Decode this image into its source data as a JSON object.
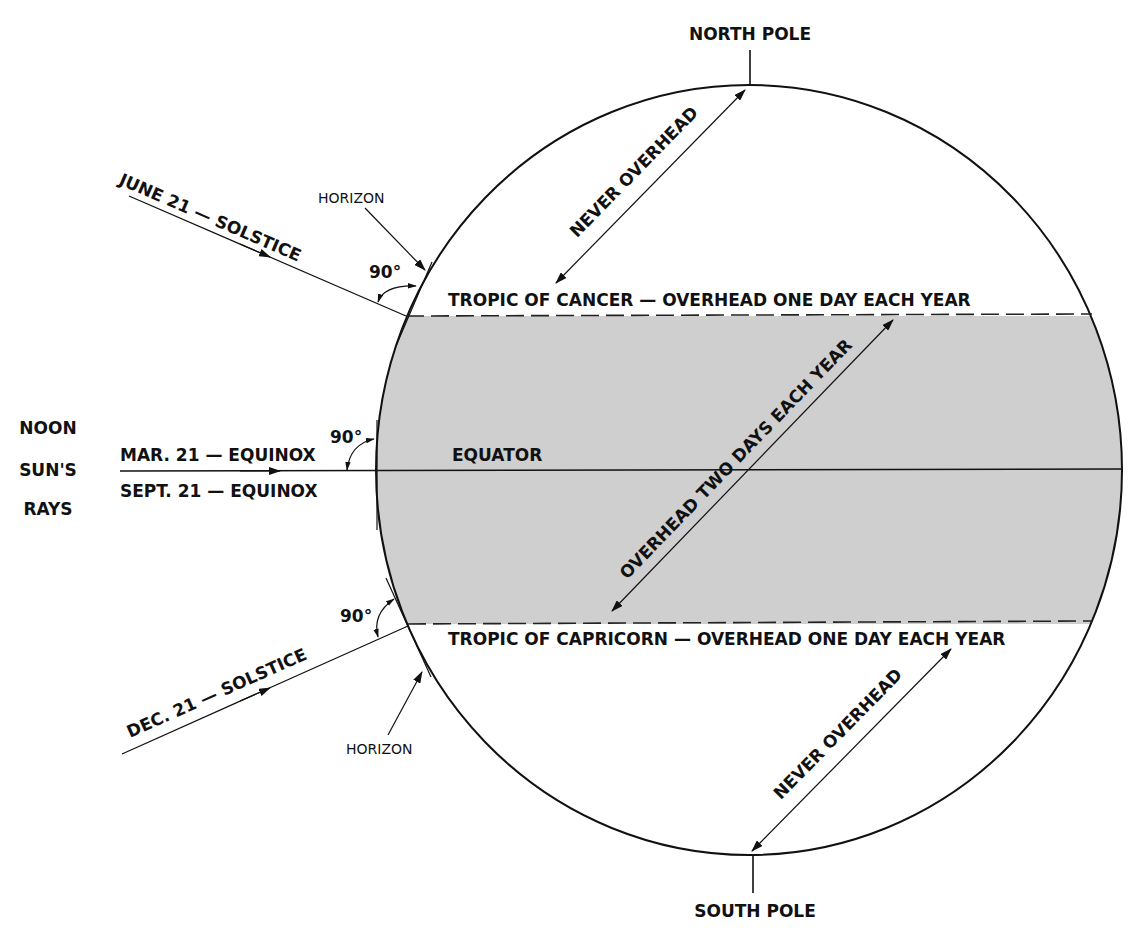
{
  "diagram": {
    "title_labels": {
      "north_pole": "NORTH POLE",
      "south_pole": "SOUTH POLE",
      "noon": "NOON",
      "suns": "SUN'S",
      "rays": "RAYS"
    },
    "rays": {
      "june": "JUNE 21 — SOLSTICE",
      "march": "MAR. 21 — EQUINOX",
      "september": "SEPT. 21 — EQUINOX",
      "december": "DEC. 21 — SOLSTICE"
    },
    "horizon_labels": {
      "top": "HORIZON",
      "bottom": "HORIZON"
    },
    "angles": {
      "june": "90°",
      "equinox": "90°",
      "december": "90°"
    },
    "latitudes": {
      "cancer": "TROPIC OF CANCER — OVERHEAD ONE DAY EACH YEAR",
      "equator": "EQUATOR",
      "capricorn": "TROPIC OF CAPRICORN — OVERHEAD ONE DAY EACH YEAR"
    },
    "zones": {
      "north_never": "NEVER OVERHEAD",
      "tropics": "OVERHEAD TWO DAYS EACH YEAR",
      "south_never": "NEVER OVERHEAD"
    },
    "colors": {
      "tropical_band": "#cfcfcf",
      "line": "#111111",
      "background": "#ffffff"
    }
  }
}
